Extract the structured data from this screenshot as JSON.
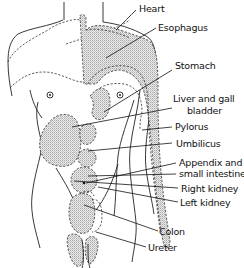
{
  "figure": {
    "labels": [
      {
        "id": "heart",
        "text": "Heart"
      },
      {
        "id": "esophagus",
        "text": "Esophagus"
      },
      {
        "id": "stomach",
        "text": "Stomach"
      },
      {
        "id": "liver",
        "text": "Liver and gall bladder"
      },
      {
        "id": "liver_line1",
        "text": "Liver and gall"
      },
      {
        "id": "liver_line2",
        "text": "bladder"
      },
      {
        "id": "pylorus",
        "text": "Pylorus"
      },
      {
        "id": "umbilicus",
        "text": "Umbilicus"
      },
      {
        "id": "appendix_line1",
        "text": "Appendix and"
      },
      {
        "id": "appendix_line2",
        "text": "small intestine"
      },
      {
        "id": "right_kidney",
        "text": "Right kidney"
      },
      {
        "id": "left_kidney",
        "text": "Left kidney"
      },
      {
        "id": "colon",
        "text": "Colon"
      },
      {
        "id": "ureter",
        "text": "Ureter"
      }
    ]
  },
  "labels": {
    "heart": "Heart",
    "esophagus": "Esophagus",
    "stomach": "Stomach",
    "liver_line1": "Liver and gall",
    "liver_line2": "bladder",
    "pylorus": "Pylorus",
    "umbilicus": "Umbilicus",
    "appendix_line1": "Appendix and",
    "appendix_line2": "small intestine",
    "right_kidney": "Right kidney",
    "left_kidney": "Left kidney",
    "colon": "Colon",
    "ureter": "Ureter"
  },
  "colors": {
    "line": "#222222",
    "stipple": "#bdbdbd",
    "background": "#ffffff"
  }
}
